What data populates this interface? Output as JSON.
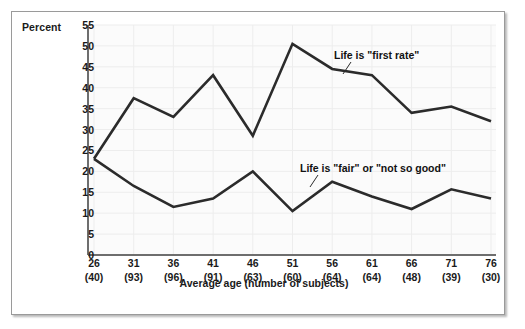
{
  "figure": {
    "percent_axis_label": "Percent",
    "xaxis_title_line1": "Average age",
    "xaxis_title_line2": "(number of subjects)"
  },
  "colors": {
    "line": "#2b2b2b",
    "plot_background": "#fbfbfb",
    "grid": "#ededed",
    "axis": "#6e6e6e",
    "frame_border": "#9a9a9a",
    "text": "#1a1a1a"
  },
  "chart_data": {
    "type": "line",
    "title": "",
    "xlabel": "Average age (number of subjects)",
    "ylabel": "Percent",
    "ylim": [
      0,
      55
    ],
    "yticks": [
      0,
      5,
      10,
      15,
      20,
      25,
      30,
      35,
      40,
      45,
      50,
      55
    ],
    "grid": true,
    "legend_position": "inline-annotations",
    "categories": [
      26,
      31,
      36,
      41,
      46,
      51,
      56,
      61,
      66,
      71,
      76
    ],
    "tick_labels": [
      {
        "age": "26",
        "count": "(40)"
      },
      {
        "age": "31",
        "count": "(93)"
      },
      {
        "age": "36",
        "count": "(96)"
      },
      {
        "age": "41",
        "count": "(91)"
      },
      {
        "age": "46",
        "count": "(63)"
      },
      {
        "age": "51",
        "count": "(60)"
      },
      {
        "age": "56",
        "count": "(64)"
      },
      {
        "age": "61",
        "count": "(64)"
      },
      {
        "age": "66",
        "count": "(48)"
      },
      {
        "age": "71",
        "count": "(39)"
      },
      {
        "age": "76",
        "count": "(30)"
      }
    ],
    "number_of_subjects": [
      40,
      93,
      96,
      91,
      63,
      60,
      64,
      64,
      48,
      39,
      30
    ],
    "series": [
      {
        "name": "Life is \"first rate\"",
        "values": [
          23,
          37.5,
          33,
          43,
          28.5,
          50.5,
          44.5,
          43,
          34,
          35.5,
          32
        ]
      },
      {
        "name": "Life is \"fair\" or \"not so good\"",
        "values": [
          23,
          16.5,
          11.5,
          13.5,
          20,
          10.5,
          17.5,
          14,
          11,
          15.7,
          13.5
        ]
      }
    ]
  }
}
